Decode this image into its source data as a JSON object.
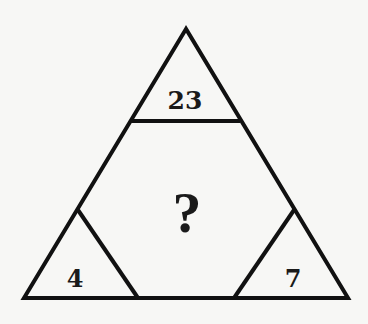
{
  "puzzle": {
    "type": "number-triangle-puzzle",
    "cells": {
      "top": "23",
      "center": "?",
      "bottom_left": "4",
      "bottom_right": "7"
    },
    "colors": {
      "background": "#f7f7f5",
      "line": "#111111",
      "text": "#1a1a1a"
    }
  }
}
